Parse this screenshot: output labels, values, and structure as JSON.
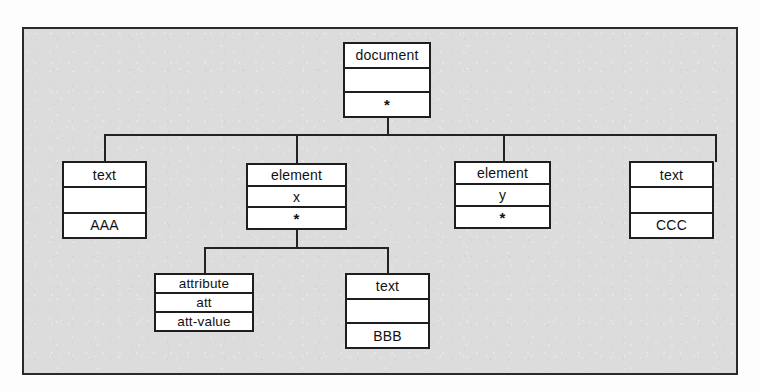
{
  "diagram": {
    "frame": {
      "background_color": "#dcdcdc",
      "border_color": "#2b2b2b"
    },
    "node_style": {
      "fill_color": "#ffffff",
      "border_color": "#1e1e1e"
    },
    "edge_color": "#222222",
    "star_symbol": "*",
    "nodes": [
      {
        "id": "document",
        "type_label": "document",
        "name_label": "",
        "value_label": "*",
        "level": 0
      },
      {
        "id": "text-aaa",
        "type_label": "text",
        "name_label": "",
        "value_label": "AAA",
        "level": 1
      },
      {
        "id": "element-x",
        "type_label": "element",
        "name_label": "x",
        "value_label": "*",
        "level": 1
      },
      {
        "id": "element-y",
        "type_label": "element",
        "name_label": "y",
        "value_label": "*",
        "level": 1
      },
      {
        "id": "text-ccc",
        "type_label": "text",
        "name_label": "",
        "value_label": "CCC",
        "level": 1
      },
      {
        "id": "attribute-att",
        "type_label": "attribute",
        "name_label": "att",
        "value_label": "att-value",
        "level": 2
      },
      {
        "id": "text-bbb",
        "type_label": "text",
        "name_label": "",
        "value_label": "BBB",
        "level": 2
      }
    ],
    "edges": [
      {
        "from": "document",
        "to": "text-aaa"
      },
      {
        "from": "document",
        "to": "element-x"
      },
      {
        "from": "document",
        "to": "element-y"
      },
      {
        "from": "document",
        "to": "text-ccc"
      },
      {
        "from": "element-x",
        "to": "attribute-att"
      },
      {
        "from": "element-x",
        "to": "text-bbb"
      }
    ]
  }
}
